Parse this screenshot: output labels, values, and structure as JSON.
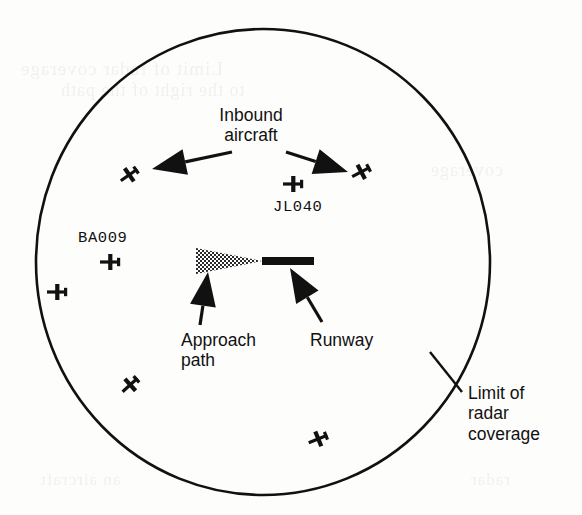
{
  "figure": {
    "name": "air-traffic-control-radar-screen",
    "width": 582,
    "height": 515,
    "background_color": "#fdfdfc",
    "ink_color": "#111111"
  },
  "radar": {
    "coverage_circle": {
      "label": "radar coverage boundary",
      "center_x": 263,
      "center_y": 262,
      "radius_x": 227,
      "radius_y": 233,
      "stroke_color": "#111111",
      "stroke_width": 2.6
    },
    "runway": {
      "label_text": "Runway",
      "x": 262,
      "y": 261,
      "length": 52,
      "thickness": 8,
      "fill_color": "#111111"
    },
    "approach_path": {
      "label_text": "Approach\npath",
      "apex_x": 262,
      "apex_y": 261,
      "base_x": 196,
      "half_height": 13,
      "pattern": "stipple-halftone",
      "fill_color": "#3a3a3a"
    }
  },
  "callouts": [
    {
      "name": "inbound-aircraft-callout",
      "text": "Inbound\naircraft",
      "align": "center",
      "x": 196,
      "y": 105,
      "width": 110
    },
    {
      "name": "approach-path-callout",
      "text": "Approach\npath",
      "align": "left",
      "x": 181,
      "y": 330,
      "width": 100
    },
    {
      "name": "runway-callout",
      "text": "Runway",
      "align": "left",
      "x": 310,
      "y": 330,
      "width": 90
    },
    {
      "name": "radar-limit-callout",
      "text": "Limit of\nradar\ncoverage",
      "align": "left",
      "x": 468,
      "y": 383,
      "width": 105
    }
  ],
  "pointer_arrows": [
    {
      "name": "inbound-left-arrow",
      "points_to": "aircraft left of centre",
      "tail_x": 232,
      "tail_y": 152,
      "head_x": 152,
      "head_y": 169,
      "head_width": 26,
      "head_length": 34
    },
    {
      "name": "inbound-right-arrow",
      "points_to": "aircraft right of centre",
      "tail_x": 286,
      "tail_y": 152,
      "head_x": 348,
      "head_y": 172,
      "head_width": 26,
      "head_length": 34
    },
    {
      "name": "approach-path-arrow",
      "points_to": "approach path cone",
      "tail_x": 200,
      "tail_y": 325,
      "head_x": 208,
      "head_y": 272,
      "head_width": 26,
      "head_length": 34
    },
    {
      "name": "runway-arrow",
      "points_to": "runway bar",
      "tail_x": 322,
      "tail_y": 322,
      "head_x": 290,
      "head_y": 268,
      "head_width": 26,
      "head_length": 34
    },
    {
      "name": "radar-limit-arrow",
      "points_to": "coverage circle edge",
      "tail_x": 462,
      "tail_y": 392,
      "head_x": 430,
      "head_y": 352,
      "head_width": 0,
      "head_length": 0
    }
  ],
  "aircraft_blips": [
    {
      "name": "blip-upper-left",
      "x": 129,
      "y": 175,
      "rotation": -35,
      "callsign": null
    },
    {
      "name": "blip-jl040",
      "x": 293,
      "y": 184,
      "rotation": 0,
      "callsign": "JL040",
      "callsign_x": 273,
      "callsign_y": 198
    },
    {
      "name": "blip-upper-right",
      "x": 361,
      "y": 172,
      "rotation": -28,
      "callsign": null
    },
    {
      "name": "blip-ba009",
      "x": 110,
      "y": 262,
      "rotation": 0,
      "callsign": "BA009",
      "callsign_x": 78,
      "callsign_y": 229
    },
    {
      "name": "blip-far-left",
      "x": 57,
      "y": 292,
      "rotation": 0,
      "callsign": null
    },
    {
      "name": "blip-lower-left",
      "x": 130,
      "y": 385,
      "rotation": -42,
      "callsign": null
    },
    {
      "name": "blip-bottom",
      "x": 318,
      "y": 439,
      "rotation": -22,
      "callsign": null
    }
  ],
  "ghost_text": [
    {
      "text": "Limit of  radar coverage",
      "x": 20,
      "y": 58,
      "size": 19
    },
    {
      "text": "to the  right of  the  path",
      "x": 60,
      "y": 80,
      "size": 18
    },
    {
      "text": "coverage",
      "x": 430,
      "y": 160,
      "size": 18
    },
    {
      "text": "an aircraft",
      "x": 40,
      "y": 470,
      "size": 17
    },
    {
      "text": "radar",
      "x": 470,
      "y": 470,
      "size": 17
    }
  ]
}
